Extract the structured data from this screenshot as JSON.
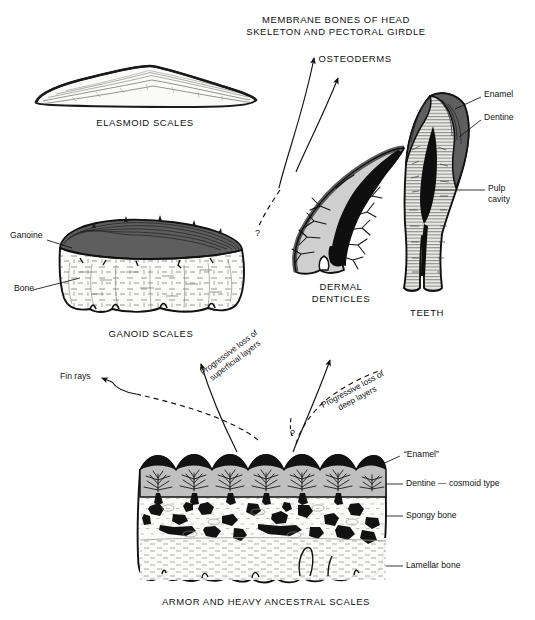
{
  "figure": {
    "title_captions": {
      "membrane_bones": "MEMBRANE BONES OF HEAD\nSKELETON AND PECTORAL GIRDLE",
      "osteoderms": "OSTEODERMS",
      "elasmoid_scales": "ELASMOID SCALES",
      "ganoid_scales": "GANOID SCALES",
      "dermal_denticles": "DERMAL\nDENTICLES",
      "teeth": "TEETH",
      "armor": "ARMOR AND HEAVY ANCESTRAL SCALES"
    },
    "part_labels": {
      "ganoine": "Ganoine",
      "bone": "Bone",
      "enamel": "Enamel",
      "dentine": "Dentine",
      "pulp_cavity": "Pulp\ncavity",
      "fin_rays": "Fin rays",
      "armor_enamel": "“Enamel”",
      "armor_dentine": "Dentine — cosmoid type",
      "spongy_bone": "Spongy bone",
      "lamellar_bone": "Lamellar bone"
    },
    "transition_labels": {
      "loss_superficial": "Progressive loss of\nsuperficial layers",
      "loss_deep": "Progressive loss of\ndeep layers"
    },
    "uncertainty_markers": {
      "left": "?",
      "center": "?"
    },
    "colors": {
      "ink": "#111111",
      "enamel_dark": "#5e5e5e",
      "dentine_gray": "#b8b8b8",
      "bone_light": "#f4f4f2",
      "cavity_black": "#101010",
      "page": "#ffffff"
    }
  }
}
